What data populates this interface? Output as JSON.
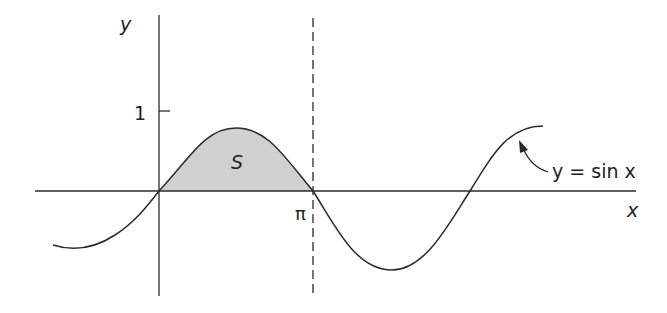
{
  "figure": {
    "function_label": "y = sin x",
    "region_label": "S",
    "x_axis_label": "x",
    "y_axis_label": "y",
    "y_tick_label": "1",
    "x_tick_label": "π"
  },
  "colors": {
    "stroke": "#2a2a2a",
    "shade": "#d0d0d0",
    "background": "#ffffff"
  }
}
